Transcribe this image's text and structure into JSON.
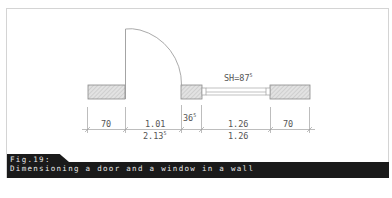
{
  "figure": {
    "label": "Fig.19:",
    "caption": "Dimensioning a door and a window in a wall"
  },
  "window_label": {
    "text": "SH=87",
    "superscript": "5"
  },
  "dimensions": {
    "row1": [
      {
        "text": "70",
        "sup": ""
      },
      {
        "text": "1.01",
        "sup": ""
      },
      {
        "text": "36",
        "sup": "5"
      },
      {
        "text": "1.26",
        "sup": ""
      },
      {
        "text": "70",
        "sup": ""
      }
    ],
    "row2": [
      {
        "text": "2.13",
        "sup": "5"
      },
      {
        "text": "1.26",
        "sup": ""
      }
    ]
  },
  "colors": {
    "line": "#9a9a9a",
    "wall_fill": "#d9d9d9",
    "caption_bg": "#1a1a1a",
    "caption_text": "#e8e8e8"
  }
}
